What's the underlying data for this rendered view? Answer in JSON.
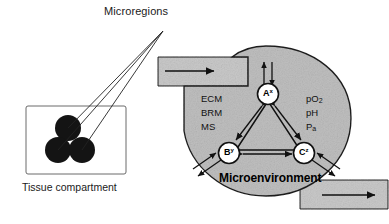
{
  "figure": {
    "title_text": "Microregions",
    "tissue_compartment_label": "Tissue compartment",
    "microenvironment_label": "Microenvironment",
    "background_color": "#ffffff",
    "ink_color": "#111111",
    "blob_fill": "#bfbfbf",
    "band_fill": "#c9c9c9"
  },
  "tissue": {
    "label": "Tissue compartment",
    "microregion_count": 3,
    "microregion_fill": "#141414"
  },
  "pointer": {
    "label": "Microregions",
    "line_count": 3
  },
  "microenvironment": {
    "label": "Microenvironment",
    "left_factors": [
      {
        "text": "ECM"
      },
      {
        "text": "BRM"
      },
      {
        "text": "MS"
      }
    ],
    "right_factors": [
      {
        "text": "pO",
        "sub": "2"
      },
      {
        "text": "pH",
        "sub": ""
      },
      {
        "text": "P",
        "sub": "a"
      }
    ],
    "nodes": [
      {
        "id": "A",
        "label": "A",
        "sup": "x",
        "cx": 268,
        "cy": 94
      },
      {
        "id": "B",
        "label": "B",
        "sup": "y",
        "cx": 229,
        "cy": 153
      },
      {
        "id": "C",
        "label": "C",
        "sup": "z",
        "cx": 304,
        "cy": 153
      }
    ],
    "edges": [
      {
        "from": "A",
        "to": "B",
        "type": "double-arrow"
      },
      {
        "from": "A",
        "to": "C",
        "type": "double-arrow"
      },
      {
        "from": "B",
        "to": "C",
        "type": "double-arrow"
      }
    ],
    "exchange_arrows": [
      {
        "at": "A",
        "direction": "vertical",
        "type": "double-arrow"
      },
      {
        "at": "B",
        "direction": "down-left",
        "type": "double-arrow"
      },
      {
        "at": "C",
        "direction": "down-right",
        "type": "double-arrow"
      }
    ]
  },
  "flow": {
    "inlet": {
      "direction": "right",
      "position": "top-left"
    },
    "outlet": {
      "direction": "right",
      "position": "bottom-right"
    }
  }
}
